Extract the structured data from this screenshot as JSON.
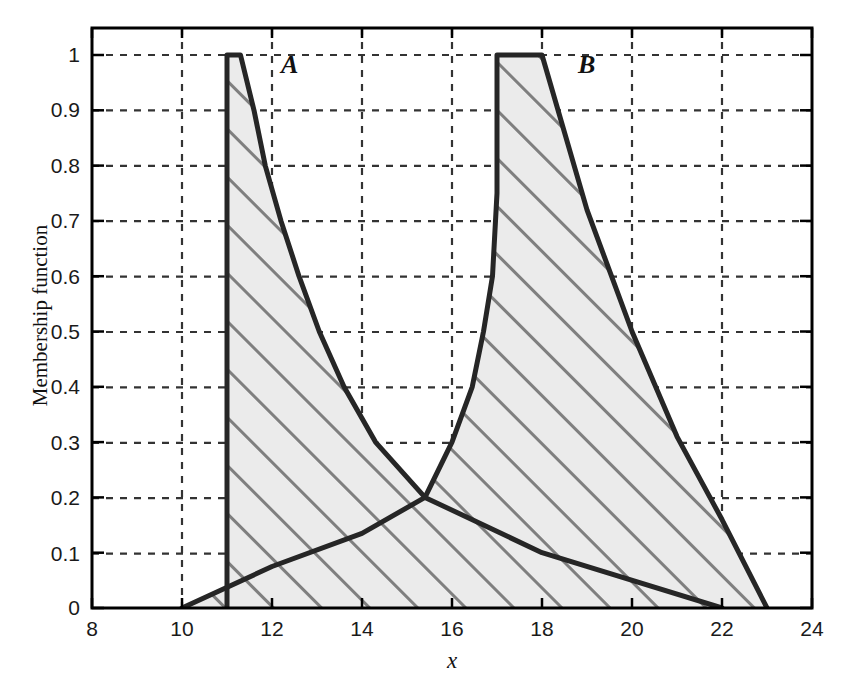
{
  "chart_data": {
    "type": "line",
    "title": "",
    "xlabel": "x",
    "ylabel": "Membership function",
    "xlim": [
      8,
      24
    ],
    "ylim": [
      0,
      1
    ],
    "xticks": [
      8,
      10,
      12,
      14,
      16,
      18,
      20,
      22,
      24
    ],
    "xtick_labels": [
      "8",
      "10",
      "12",
      "14",
      "16",
      "18",
      "20",
      "22",
      "24"
    ],
    "yticks": [
      0,
      0.1,
      0.2,
      0.3,
      0.4,
      0.5,
      0.6,
      0.7,
      0.8,
      0.9,
      1
    ],
    "ytick_labels": [
      "0",
      "0.1",
      "0.2",
      "0.3",
      "0.4",
      "0.5",
      "0.6",
      "0.7",
      "0.8",
      "0.9",
      "1"
    ],
    "grid": true,
    "grid_style": "dashed",
    "legend": "none",
    "annotations": [
      {
        "text": "A",
        "x": 12.4,
        "y": 0.96
      },
      {
        "text": "B",
        "x": 19.0,
        "y": 0.96
      }
    ],
    "series": [
      {
        "name": "A",
        "label": "A",
        "fill": "hatched",
        "points": [
          [
            11.0,
            0.0
          ],
          [
            11.0,
            1.0
          ],
          [
            11.3,
            1.0
          ],
          [
            11.6,
            0.9
          ],
          [
            11.85,
            0.8
          ],
          [
            12.2,
            0.7
          ],
          [
            12.6,
            0.6
          ],
          [
            13.05,
            0.5
          ],
          [
            13.6,
            0.4
          ],
          [
            14.3,
            0.3
          ],
          [
            15.4,
            0.2
          ],
          [
            18.0,
            0.1
          ],
          [
            22.0,
            0.0
          ],
          [
            11.0,
            0.0
          ]
        ]
      },
      {
        "name": "B",
        "label": "B",
        "fill": "hatched",
        "points": [
          [
            10.0,
            0.0
          ],
          [
            12.0,
            0.075
          ],
          [
            14.0,
            0.135
          ],
          [
            15.4,
            0.2
          ],
          [
            16.0,
            0.3
          ],
          [
            16.45,
            0.4
          ],
          [
            16.7,
            0.5
          ],
          [
            16.9,
            0.6
          ],
          [
            17.0,
            0.75
          ],
          [
            17.0,
            1.0
          ],
          [
            18.0,
            1.0
          ],
          [
            19.0,
            0.72
          ],
          [
            20.0,
            0.5
          ],
          [
            21.0,
            0.31
          ],
          [
            22.0,
            0.16
          ],
          [
            23.0,
            0.0
          ],
          [
            10.0,
            0.0
          ]
        ]
      }
    ],
    "colors": {
      "curve_stroke": "#262626",
      "fill": "#ebebeb",
      "hatch": "#7f7f7f",
      "grid": "#333333",
      "axis": "#000000",
      "background": "#ffffff"
    }
  },
  "axes": {
    "xlabel": "x",
    "ylabel": "Membership function",
    "xtick_labels": [
      "8",
      "10",
      "12",
      "14",
      "16",
      "18",
      "20",
      "22",
      "24"
    ],
    "ytick_labels": [
      "0",
      "0.1",
      "0.2",
      "0.3",
      "0.4",
      "0.5",
      "0.6",
      "0.7",
      "0.8",
      "0.9",
      "1"
    ]
  },
  "labels": {
    "a": "A",
    "b": "B"
  }
}
